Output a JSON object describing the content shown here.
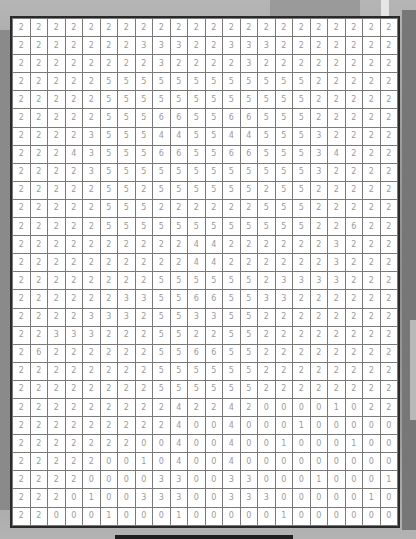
{
  "puzzle": {
    "columns": 22,
    "rows": 28,
    "grid": [
      [
        2,
        2,
        2,
        2,
        2,
        2,
        2,
        2,
        2,
        2,
        2,
        2,
        2,
        2,
        2,
        2,
        2,
        2,
        2,
        2,
        2,
        2
      ],
      [
        2,
        2,
        2,
        2,
        2,
        2,
        2,
        3,
        3,
        3,
        2,
        2,
        3,
        3,
        3,
        2,
        2,
        2,
        2,
        2,
        2,
        2
      ],
      [
        2,
        2,
        2,
        2,
        2,
        2,
        2,
        2,
        3,
        2,
        2,
        2,
        2,
        3,
        2,
        2,
        2,
        2,
        2,
        2,
        2,
        2
      ],
      [
        2,
        2,
        2,
        2,
        2,
        5,
        5,
        5,
        5,
        5,
        5,
        5,
        5,
        5,
        5,
        5,
        5,
        2,
        2,
        2,
        2,
        2
      ],
      [
        2,
        2,
        2,
        2,
        2,
        5,
        5,
        5,
        5,
        5,
        5,
        5,
        5,
        5,
        5,
        5,
        5,
        2,
        2,
        2,
        2,
        2
      ],
      [
        2,
        2,
        2,
        2,
        2,
        5,
        5,
        5,
        6,
        6,
        5,
        5,
        6,
        6,
        5,
        5,
        5,
        2,
        2,
        2,
        2,
        2
      ],
      [
        2,
        2,
        2,
        2,
        3,
        5,
        5,
        5,
        4,
        4,
        5,
        5,
        4,
        4,
        5,
        5,
        5,
        3,
        2,
        2,
        2,
        2
      ],
      [
        2,
        2,
        2,
        4,
        3,
        5,
        5,
        5,
        6,
        6,
        5,
        5,
        6,
        6,
        5,
        5,
        5,
        3,
        4,
        2,
        2,
        2
      ],
      [
        2,
        2,
        2,
        2,
        3,
        5,
        5,
        5,
        5,
        5,
        5,
        5,
        5,
        5,
        5,
        5,
        5,
        3,
        2,
        2,
        2,
        2
      ],
      [
        2,
        2,
        2,
        2,
        2,
        5,
        5,
        2,
        5,
        5,
        5,
        5,
        5,
        5,
        2,
        5,
        5,
        2,
        2,
        2,
        2,
        2
      ],
      [
        2,
        2,
        2,
        2,
        2,
        5,
        5,
        5,
        2,
        2,
        2,
        2,
        2,
        2,
        5,
        5,
        5,
        2,
        2,
        2,
        2,
        2
      ],
      [
        2,
        2,
        2,
        2,
        2,
        5,
        5,
        5,
        5,
        5,
        5,
        5,
        5,
        5,
        5,
        5,
        5,
        2,
        2,
        6,
        2,
        2
      ],
      [
        2,
        2,
        2,
        2,
        2,
        2,
        2,
        2,
        2,
        2,
        4,
        4,
        2,
        2,
        2,
        2,
        2,
        2,
        3,
        2,
        2,
        2
      ],
      [
        2,
        2,
        2,
        2,
        2,
        2,
        2,
        2,
        2,
        2,
        4,
        4,
        2,
        2,
        2,
        2,
        2,
        2,
        3,
        2,
        2,
        2
      ],
      [
        2,
        2,
        2,
        2,
        2,
        2,
        2,
        2,
        5,
        5,
        5,
        5,
        5,
        5,
        2,
        3,
        3,
        3,
        3,
        2,
        2,
        2
      ],
      [
        2,
        2,
        2,
        2,
        2,
        2,
        3,
        3,
        5,
        5,
        6,
        6,
        5,
        5,
        3,
        3,
        2,
        2,
        2,
        2,
        2,
        2
      ],
      [
        2,
        2,
        2,
        2,
        3,
        3,
        3,
        2,
        5,
        5,
        3,
        3,
        5,
        5,
        2,
        2,
        2,
        2,
        2,
        2,
        2,
        2
      ],
      [
        2,
        2,
        3,
        3,
        3,
        2,
        2,
        2,
        5,
        5,
        2,
        2,
        5,
        5,
        2,
        2,
        2,
        2,
        2,
        2,
        2,
        2
      ],
      [
        2,
        6,
        2,
        2,
        2,
        2,
        2,
        2,
        5,
        5,
        6,
        6,
        5,
        5,
        2,
        2,
        2,
        2,
        2,
        2,
        2,
        2
      ],
      [
        2,
        2,
        2,
        2,
        2,
        2,
        2,
        2,
        5,
        5,
        5,
        5,
        5,
        5,
        2,
        2,
        2,
        2,
        2,
        2,
        2,
        2
      ],
      [
        2,
        2,
        2,
        2,
        2,
        2,
        2,
        2,
        5,
        5,
        5,
        5,
        5,
        5,
        2,
        2,
        2,
        2,
        2,
        2,
        2,
        2
      ],
      [
        2,
        2,
        2,
        2,
        2,
        2,
        2,
        2,
        2,
        4,
        2,
        2,
        4,
        2,
        0,
        0,
        0,
        0,
        1,
        0,
        2,
        2
      ],
      [
        2,
        2,
        2,
        2,
        2,
        2,
        2,
        2,
        2,
        4,
        0,
        0,
        4,
        0,
        0,
        0,
        1,
        0,
        0,
        0,
        0,
        0
      ],
      [
        2,
        2,
        2,
        2,
        2,
        2,
        2,
        0,
        0,
        4,
        0,
        0,
        4,
        0,
        0,
        1,
        0,
        0,
        0,
        1,
        0,
        0
      ],
      [
        2,
        2,
        2,
        2,
        2,
        0,
        0,
        1,
        0,
        4,
        0,
        0,
        4,
        0,
        0,
        0,
        0,
        0,
        0,
        0,
        0,
        0
      ],
      [
        2,
        2,
        2,
        2,
        0,
        0,
        0,
        0,
        3,
        3,
        0,
        0,
        3,
        3,
        0,
        0,
        0,
        1,
        0,
        0,
        0,
        1
      ],
      [
        2,
        2,
        2,
        0,
        1,
        0,
        0,
        3,
        3,
        3,
        0,
        0,
        3,
        3,
        3,
        0,
        0,
        0,
        0,
        0,
        1,
        0
      ],
      [
        2,
        2,
        0,
        0,
        0,
        1,
        0,
        0,
        0,
        1,
        0,
        0,
        0,
        0,
        0,
        1,
        0,
        0,
        0,
        0,
        0,
        0
      ]
    ]
  },
  "colors": {
    "cell_bg": "#ffffff",
    "cell_border": "#7a7a7a",
    "frame_border": "#2a2a2a",
    "number_text": "#9a9a9a"
  }
}
